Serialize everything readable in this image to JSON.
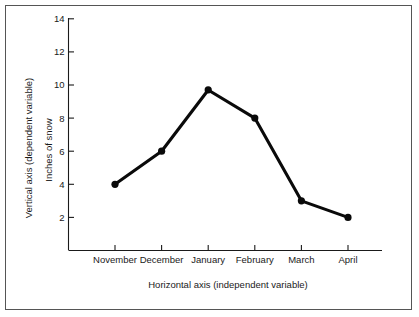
{
  "figure": {
    "background_color": "#ffffff",
    "frame_color": "#555555",
    "line_color": "#0a0a0a",
    "text_color": "#1a1a1a"
  },
  "chart_data": {
    "type": "line",
    "title": "",
    "categories": [
      "November",
      "December",
      "January",
      "February",
      "March",
      "April"
    ],
    "values": [
      4,
      6,
      9.7,
      8,
      3,
      2
    ],
    "series": [
      {
        "name": "Inches of snow",
        "values": [
          4,
          6,
          9.7,
          8,
          3,
          2
        ]
      }
    ],
    "xlabel": "Horizontal axis  (independent variable)",
    "ylabel": "Inches of snow",
    "y_outer_label": "Vertical axis  (dependent variable)",
    "yticks": [
      2,
      4,
      6,
      8,
      10,
      12,
      14
    ],
    "ytick_labels": [
      "2",
      "4",
      "6",
      "8",
      "10",
      "12",
      "14"
    ],
    "ylim": [
      0,
      14
    ],
    "xlim": [
      0,
      7
    ],
    "grid": false,
    "legend": false,
    "marker": "circle",
    "marker_color": "#0a0a0a",
    "line_width": 3.1
  }
}
